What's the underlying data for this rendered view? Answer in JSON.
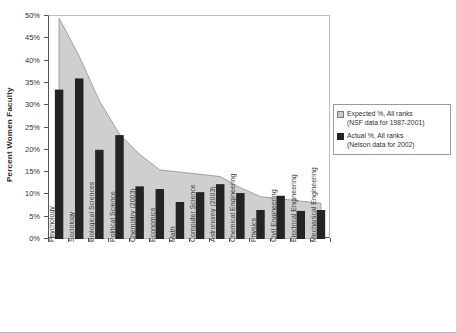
{
  "chart_data": {
    "type": "bar",
    "title": "",
    "xlabel": "",
    "ylabel": "Percent Women Faculty",
    "ylim": [
      0,
      50
    ],
    "ytick_labels": [
      "0%",
      "5%",
      "10%",
      "15%",
      "20%",
      "25%",
      "30%",
      "35%",
      "40%",
      "45%",
      "50%"
    ],
    "ytick_values": [
      0,
      5,
      10,
      15,
      20,
      25,
      30,
      35,
      40,
      45,
      50
    ],
    "grid": false,
    "legend_position": "right",
    "categories": [
      "Psychology",
      "Sociology",
      "Biological Sciences",
      "Political Science",
      "Chemistry (2003)",
      "Economics",
      "Math",
      "Computer Science",
      "Astronomy (2003)",
      "Chemical Engineering",
      "Physics",
      "Civil Engineering",
      "Electrical Engineering",
      "Mechanical Engineering"
    ],
    "series": [
      {
        "name": "Expected %, All ranks",
        "type": "area",
        "color": "#c9c9c9",
        "values": [
          49.5,
          41.0,
          31.0,
          23.5,
          19.0,
          15.5,
          15.0,
          14.5,
          14.0,
          11.5,
          9.5,
          9.0,
          8.5,
          8.0
        ]
      },
      {
        "name": "Actual %, All ranks",
        "type": "bar",
        "color": "#242424",
        "values": [
          33.5,
          36.0,
          20.0,
          23.3,
          11.8,
          11.2,
          8.3,
          10.5,
          12.3,
          10.3,
          6.5,
          9.7,
          6.3,
          6.5
        ]
      }
    ]
  },
  "legend": {
    "entries": [
      {
        "line1": "Expected %, All ranks",
        "line2": "(NSF data for 1987-2001)",
        "swatch": "expected-swatch"
      },
      {
        "line1": "Actual %, All ranks",
        "line2": "(Nelson data for 2002)",
        "swatch": "actual-swatch"
      }
    ]
  }
}
